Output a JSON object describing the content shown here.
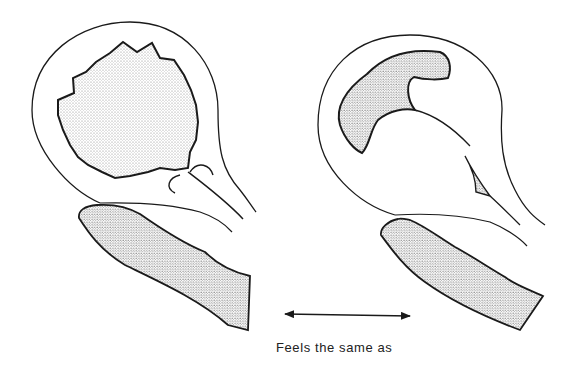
{
  "figure": {
    "caption": "Feels the same as",
    "colors": {
      "line": "#1a1a1a",
      "stipple": "#9a9a9a",
      "background": "#ffffff"
    },
    "panels": [
      {
        "id": "left",
        "description": "round sac with large stippled scalloped mass, palpating finger below"
      },
      {
        "id": "right",
        "description": "round sac with crescent-shaped stippled rim and small stippled triangle, palpating finger below"
      }
    ],
    "connector": "double-headed-arrow"
  }
}
